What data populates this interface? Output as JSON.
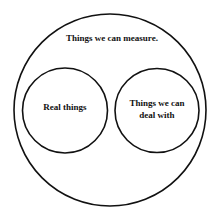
{
  "diagram": {
    "type": "venn",
    "outer": {
      "label": "Things we can measure."
    },
    "left": {
      "label": "Real things"
    },
    "right": {
      "label_line1": "Things we can",
      "label_line2": "deal with"
    },
    "stroke_color": "#111111",
    "background": "#ffffff"
  }
}
